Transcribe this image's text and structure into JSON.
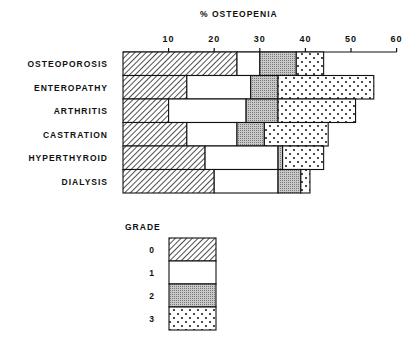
{
  "chart_data": {
    "type": "bar",
    "orientation": "horizontal",
    "stacked": true,
    "title": "% OSTEOPENIA",
    "xlabel": "% OSTEOPENIA",
    "ylabel": "",
    "xlim": [
      0,
      60
    ],
    "xticks": [
      10,
      20,
      30,
      40,
      50,
      60
    ],
    "grid": false,
    "categories": [
      "OSTEOPOROSIS",
      "ENTEROPATHY",
      "ARTHRITIS",
      "CASTRATION",
      "HYPERTHYROID",
      "DIALYSIS"
    ],
    "series": [
      {
        "name": "0",
        "pattern": "diagonal-hatch",
        "values": [
          25,
          14,
          10,
          14,
          18,
          20
        ]
      },
      {
        "name": "1",
        "pattern": "white",
        "values": [
          5,
          14,
          17,
          11,
          16,
          14
        ]
      },
      {
        "name": "2",
        "pattern": "gray-stipple",
        "values": [
          8,
          6,
          7,
          6,
          1,
          5
        ]
      },
      {
        "name": "3",
        "pattern": "dots",
        "values": [
          6,
          21,
          17,
          14,
          9,
          2
        ]
      }
    ],
    "totals": [
      44,
      55,
      51,
      45,
      44,
      41
    ],
    "legend": {
      "title": "GRADE",
      "position": "bottom-left",
      "entries": [
        "0",
        "1",
        "2",
        "3"
      ]
    }
  }
}
